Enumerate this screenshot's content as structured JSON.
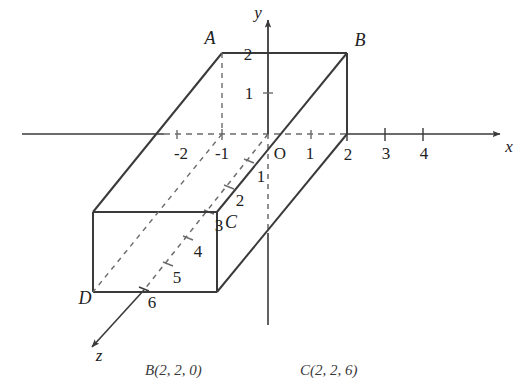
{
  "figure": {
    "type": "3d-coordinate-diagram",
    "stroke_color": "#3a3a3a",
    "dash_color": "#6b6b6b",
    "background": "#ffffff",
    "axes": {
      "x": {
        "name": "x",
        "ticks": [
          "-2",
          "-1",
          "1",
          "2",
          "3",
          "4"
        ]
      },
      "y": {
        "name": "y",
        "ticks": [
          "1",
          "2"
        ]
      },
      "z": {
        "name": "z",
        "ticks": [
          "1",
          "2",
          "3",
          "4",
          "5",
          "6"
        ]
      },
      "origin_label": "O"
    },
    "vertices": [
      {
        "id": "A",
        "label": "A"
      },
      {
        "id": "B",
        "label": "B"
      },
      {
        "id": "C",
        "label": "C"
      },
      {
        "id": "D",
        "label": "D"
      }
    ]
  },
  "caption": {
    "left": "B(2, 2, 0)",
    "right": "C(2, 2, 6)"
  }
}
